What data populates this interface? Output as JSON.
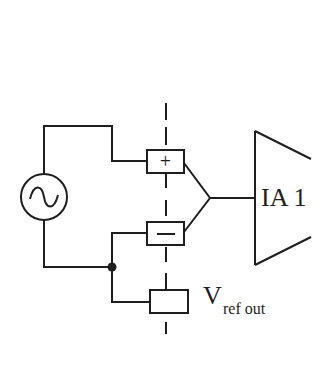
{
  "diagram": {
    "type": "circuit-schematic",
    "colors": {
      "line": "#1e1e1e",
      "background": "#ffffff"
    },
    "components": {
      "source": {
        "symbol": "ac-voltage-source",
        "glyph": "~"
      },
      "electrode_positive": {
        "symbol_label": "+"
      },
      "electrode_negative": {
        "symbol_label": "−"
      },
      "electrode_reference": {
        "symbol_label": ""
      },
      "amplifier": {
        "label": "IA 1"
      },
      "reference_output": {
        "label_main": "V",
        "label_sub": "ref out"
      }
    },
    "isolation_barrier": {
      "style": "dashed-vertical-line"
    },
    "junction": {
      "symbol": "filled-dot"
    }
  }
}
